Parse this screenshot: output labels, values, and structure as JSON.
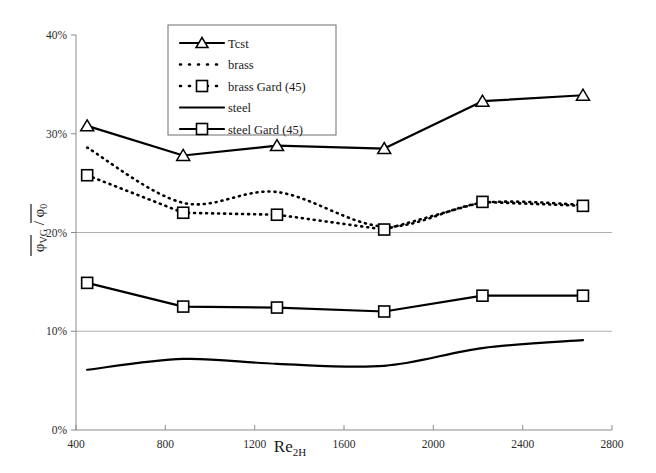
{
  "chart_data": {
    "type": "line",
    "title": "",
    "xlabel": "Re2H",
    "xlabel_base": "Re",
    "xlabel_sub": "2H",
    "ylabel": "φVG / φ0",
    "ylabel_num": "φ",
    "ylabel_num_sub": "VG",
    "ylabel_sep": "/",
    "ylabel_den": "φ",
    "ylabel_den_sub": "0",
    "xlim": [
      400,
      2800
    ],
    "ylim": [
      0,
      40
    ],
    "xticks": [
      400,
      800,
      1200,
      1600,
      2000,
      2400,
      2800
    ],
    "xticklabels": [
      "400",
      "800",
      "1200",
      "1600",
      "2000",
      "2400",
      "2800"
    ],
    "yticks": [
      0,
      10,
      20,
      30,
      40
    ],
    "yticklabels": [
      "0%",
      "10%",
      "20%",
      "30%",
      "40%"
    ],
    "gridlines_y": [
      10,
      20
    ],
    "grid": "horizontal-partial",
    "legend_position": "top-center-inside",
    "x": [
      450,
      880,
      1300,
      1780,
      2220,
      2670
    ],
    "series": [
      {
        "name": "Tcst",
        "style": "solid",
        "marker": "triangle",
        "color": "#000000",
        "values": [
          30.8,
          27.8,
          28.8,
          28.5,
          33.3,
          33.9
        ]
      },
      {
        "name": "brass",
        "style": "dotted",
        "marker": "none",
        "color": "#000000",
        "values": [
          28.6,
          23.0,
          24.1,
          20.6,
          23.0,
          22.8
        ]
      },
      {
        "name": "brass Gard (45)",
        "style": "dotted",
        "marker": "square",
        "color": "#000000",
        "values": [
          25.8,
          22.0,
          21.8,
          20.3,
          23.1,
          22.7
        ]
      },
      {
        "name": "steel",
        "style": "solid",
        "marker": "none",
        "color": "#000000",
        "values": [
          6.1,
          7.2,
          6.7,
          6.5,
          8.3,
          9.1
        ]
      },
      {
        "name": "steel Gard (45)",
        "style": "solid",
        "marker": "square",
        "color": "#000000",
        "values": [
          14.9,
          12.5,
          12.4,
          12.0,
          13.6,
          13.6
        ]
      }
    ]
  },
  "legend": {
    "entries": [
      {
        "label": "Tcst",
        "marker": "triangle",
        "style": "solid"
      },
      {
        "label": "brass",
        "marker": "none",
        "style": "dotted"
      },
      {
        "label": "brass Gard (45)",
        "marker": "square",
        "style": "dotted"
      },
      {
        "label": "steel",
        "marker": "none",
        "style": "solid"
      },
      {
        "label": "steel Gard (45)",
        "marker": "square",
        "style": "solid"
      }
    ]
  }
}
